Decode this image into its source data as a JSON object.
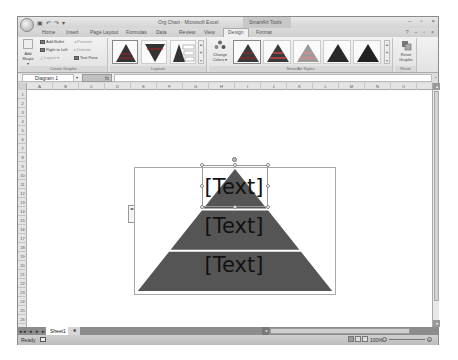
{
  "window": {
    "title": "Org Chart - Microsoft Excel",
    "context_tab_group": "SmartArt Tools",
    "controls": [
      "–",
      "▫",
      "×"
    ],
    "help_controls": [
      "?",
      "–",
      "▫",
      "×"
    ]
  },
  "quick_access": [
    "save-icon",
    "undo-icon",
    "redo-icon",
    "customize-icon"
  ],
  "quick_access_glyphs": [
    "▣",
    "↶",
    "↷",
    "▾"
  ],
  "tabs": [
    {
      "label": "Home"
    },
    {
      "label": "Insert"
    },
    {
      "label": "Page Layout"
    },
    {
      "label": "Formulas"
    },
    {
      "label": "Data"
    },
    {
      "label": "Review"
    },
    {
      "label": "View"
    },
    {
      "label": "Design",
      "active": true
    },
    {
      "label": "Format"
    }
  ],
  "ribbon": {
    "create_graphic": {
      "label": "Create Graphic",
      "add_shape": "Add Shape ▾",
      "add_bullet": "Add Bullet",
      "right_to_left": "Right to Left",
      "layout": "Layout ▾",
      "promote": "Promote",
      "demote": "Demote",
      "text_pane": "Text Pane"
    },
    "layouts": {
      "label": "Layouts",
      "items": [
        "Basic Pyramid",
        "Inverted Pyramid",
        "Pyramid List"
      ]
    },
    "smartart_styles": {
      "label": "SmartArt Styles",
      "change_colors": "Change Colors ▾",
      "items": [
        "Simple Fill",
        "Subtle Effect",
        "White Outline",
        "Moderate Effect",
        "Intense Effect"
      ]
    },
    "reset": {
      "label": "Reset",
      "reset_graphic": "Reset Graphic"
    },
    "gallery_scroll": [
      "▲",
      "▼",
      "▾"
    ]
  },
  "formula_bar": {
    "name_box": "Diagram 1",
    "fx": "fx",
    "value": ""
  },
  "columns": [
    "A",
    "B",
    "C",
    "D",
    "E",
    "F",
    "G",
    "H",
    "I",
    "J",
    "K",
    "L",
    "M",
    "N",
    "O"
  ],
  "rows": [
    "1",
    "2",
    "3",
    "4",
    "5",
    "6",
    "7",
    "8",
    "9",
    "10",
    "11",
    "12",
    "13",
    "14",
    "15",
    "16",
    "17",
    "18",
    "19",
    "20",
    "21",
    "22",
    "23",
    "24",
    "25",
    "26",
    "27"
  ],
  "smartart": {
    "type": "Basic Pyramid",
    "fill_color": "#555555",
    "levels": [
      {
        "text": "[Text]"
      },
      {
        "text": "[Text]"
      },
      {
        "text": "[Text]"
      }
    ],
    "text_pane_toggle": "◂▸"
  },
  "sheets": {
    "nav": "◂◂ ◂ ▸ ▸▸",
    "tabs": [
      {
        "label": "Sheet1",
        "active": true
      }
    ],
    "insert_tab_icon": "✱"
  },
  "status": {
    "text": "Ready",
    "zoom": "100%",
    "zoom_minus": "–",
    "zoom_plus": "+"
  },
  "scroll": {
    "up": "▴",
    "down": "▾",
    "left": "◂",
    "split": "≡"
  }
}
